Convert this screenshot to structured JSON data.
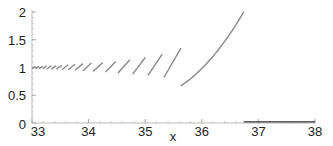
{
  "chart_data": {
    "type": "line",
    "title": "",
    "xlabel": "x",
    "ylabel": "",
    "xlim": [
      33,
      38
    ],
    "ylim": [
      0,
      2
    ],
    "grid": false,
    "legend": null,
    "x_ticks": [
      "33",
      "34",
      "35",
      "36",
      "37",
      "38"
    ],
    "y_ticks": [
      "0",
      "0.5",
      "1",
      "1.5",
      "2"
    ],
    "line_color": "#888888",
    "flat_line_color": "#333333",
    "series": [
      {
        "name": "branch-hatch-1",
        "x": [
          33.0,
          33.06
        ],
        "y": [
          0.98,
          1.02
        ]
      },
      {
        "name": "branch-hatch-2",
        "x": [
          33.06,
          33.12
        ],
        "y": [
          0.98,
          1.02
        ]
      },
      {
        "name": "branch-hatch-3",
        "x": [
          33.12,
          33.19
        ],
        "y": [
          0.98,
          1.02
        ]
      },
      {
        "name": "branch-hatch-4",
        "x": [
          33.19,
          33.26
        ],
        "y": [
          0.98,
          1.03
        ]
      },
      {
        "name": "branch-hatch-5",
        "x": [
          33.26,
          33.34
        ],
        "y": [
          0.97,
          1.03
        ]
      },
      {
        "name": "branch-hatch-6",
        "x": [
          33.34,
          33.43
        ],
        "y": [
          0.97,
          1.03
        ]
      },
      {
        "name": "branch-hatch-7",
        "x": [
          33.43,
          33.53
        ],
        "y": [
          0.97,
          1.04
        ]
      },
      {
        "name": "branch-hatch-8",
        "x": [
          33.53,
          33.64
        ],
        "y": [
          0.96,
          1.05
        ]
      },
      {
        "name": "branch-hatch-9",
        "x": [
          33.64,
          33.76
        ],
        "y": [
          0.96,
          1.06
        ]
      },
      {
        "name": "branch-hatch-10",
        "x": [
          33.76,
          33.9
        ],
        "y": [
          0.95,
          1.07
        ]
      },
      {
        "name": "branch-hatch-11",
        "x": [
          33.9,
          34.05
        ],
        "y": [
          0.94,
          1.08
        ]
      },
      {
        "name": "branch-12",
        "x": [
          34.08,
          34.25
        ],
        "y": [
          0.93,
          1.09
        ]
      },
      {
        "name": "branch-13",
        "x": [
          34.3,
          34.48
        ],
        "y": [
          0.92,
          1.11
        ]
      },
      {
        "name": "branch-14",
        "x": [
          34.52,
          34.73
        ],
        "y": [
          0.9,
          1.14
        ]
      },
      {
        "name": "branch-15",
        "x": [
          34.78,
          35.0
        ],
        "y": [
          0.88,
          1.18
        ]
      },
      {
        "name": "branch-16",
        "x": [
          35.05,
          35.3
        ],
        "y": [
          0.86,
          1.24
        ]
      },
      {
        "name": "branch-17",
        "x": [
          35.33,
          35.63
        ],
        "y": [
          0.82,
          1.35
        ]
      },
      {
        "name": "branch-18",
        "x": [
          35.63,
          36.74
        ],
        "y": [
          0.67,
          2.0
        ]
      },
      {
        "name": "flat-tail",
        "x": [
          36.74,
          38.0
        ],
        "y": [
          0.02,
          0.02
        ]
      }
    ]
  }
}
